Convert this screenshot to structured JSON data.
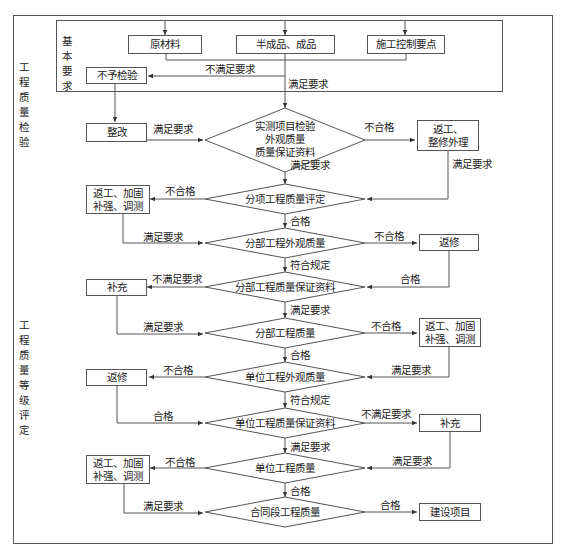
{
  "diagram": {
    "sections": {
      "inspection": "工程质量检验",
      "grading": "工程质量等级评定",
      "basic_requirements": "基本要求"
    },
    "nodes": {
      "raw_materials": "原材料",
      "semi_finished": "半成品、成品",
      "construction_control": "施工控制要点",
      "no_inspection": "不予检验",
      "rectify": "整改",
      "rework_repair_top": "返工、\n整修外理",
      "measured_items": "实测项目检验\n外观质量\n质量保证资料",
      "sub_item_eval": "分项工程质量评定",
      "rework_reinforce_1": "返工、加固\n补强、调测",
      "division_appearance": "分部工程外观质量",
      "repair_1": "返修",
      "division_docs": "分部工程质量保证资料",
      "supplement_1": "补充",
      "division_quality": "分部工程质量",
      "rework_reinforce_2": "返工、加固\n补强、调测",
      "unit_appearance": "单位工程外观质量",
      "repair_2": "返修",
      "unit_docs": "单位工程质量保证资料",
      "supplement_2": "补充",
      "unit_quality": "单位工程质量",
      "rework_reinforce_3": "返工、加固\n补强、调测",
      "contract_quality": "合同段工程质量",
      "construction_project": "建设项目"
    },
    "edge_labels": {
      "not_meet_top": "不满足要求",
      "meet_top": "满足要求",
      "rectify_meet": "满足要求",
      "measured_fail": "不合格",
      "measured_meet": "满足要求",
      "rework_top_meet": "满足要求",
      "subitem_fail": "不合格",
      "subitem_pass": "合格",
      "rework1_meet": "满足要求",
      "div_app_fail": "不合格",
      "div_app_ok": "符合规定",
      "repair1_pass": "合格",
      "div_docs_notmeet": "不满足要求",
      "div_docs_meet": "满足要求",
      "supp1_meet": "满足要求",
      "div_q_fail": "不合格",
      "div_q_pass": "合格",
      "rework2_meet": "满足要求",
      "unit_app_fail": "不合格",
      "unit_app_ok": "符合规定",
      "repair2_pass": "合格",
      "unit_docs_notmeet": "不满足要求",
      "unit_docs_meet": "满足要求",
      "supp2_meet": "满足要求",
      "unit_q_fail": "不合格",
      "unit_q_pass": "合格",
      "rework3_meet": "满足要求",
      "contract_pass": "合格"
    }
  }
}
